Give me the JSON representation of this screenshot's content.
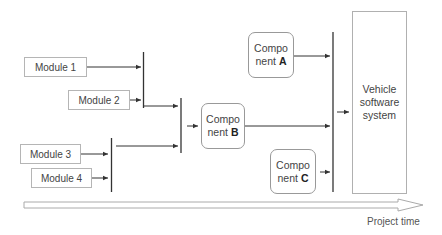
{
  "modules": [
    {
      "label": "Module 1"
    },
    {
      "label": "Module 2"
    },
    {
      "label": "Module 3"
    },
    {
      "label": "Module 4"
    }
  ],
  "components": [
    {
      "line1": "Compo",
      "line2_prefix": "nent ",
      "letter": "A"
    },
    {
      "line1": "Compo",
      "line2_prefix": "nent ",
      "letter": "B"
    },
    {
      "line1": "Compo",
      "line2_prefix": "nent ",
      "letter": "C"
    }
  ],
  "vehicle": {
    "line1": "Vehicle",
    "line2": "software",
    "line3": "system"
  },
  "timeline": {
    "label": "Project time"
  },
  "colors": {
    "line": "#333333",
    "box_border": "#aaaaaa",
    "arrow_outline": "#aaaaaa"
  }
}
